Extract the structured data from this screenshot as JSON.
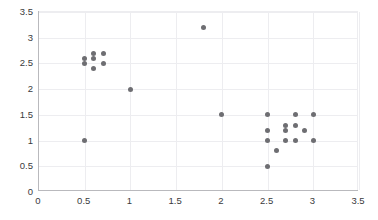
{
  "chart_data": {
    "type": "scatter",
    "title": "",
    "xlabel": "",
    "ylabel": "",
    "xlim": [
      0,
      3.5
    ],
    "ylim": [
      0,
      3.5
    ],
    "xticks": [
      "0",
      "0.5",
      "1",
      "1.5",
      "2",
      "2.5",
      "3",
      "3.5"
    ],
    "xtick_values": [
      0,
      0.5,
      1,
      1.5,
      2,
      2.5,
      3,
      3.5
    ],
    "yticks": [
      "0",
      "0.5",
      "1",
      "1.5",
      "2",
      "2.5",
      "3",
      "3.5"
    ],
    "ytick_values": [
      0,
      0.5,
      1,
      1.5,
      2,
      2.5,
      3,
      3.5
    ],
    "grid": true,
    "legend": null,
    "marker_color": "#6e6e72",
    "grid_color": "#ededf0",
    "axis_color": "#b9b9bd",
    "tick_label_color": "#3a3a3c",
    "series": [
      {
        "name": "points",
        "color": "#6e6e72",
        "marker": "circle",
        "points": [
          [
            0.5,
            2.6
          ],
          [
            0.5,
            2.5
          ],
          [
            0.6,
            2.7
          ],
          [
            0.6,
            2.6
          ],
          [
            0.6,
            2.4
          ],
          [
            0.7,
            2.7
          ],
          [
            0.7,
            2.5
          ],
          [
            0.5,
            1.0
          ],
          [
            1.0,
            2.0
          ],
          [
            1.8,
            3.2
          ],
          [
            2.0,
            1.5
          ],
          [
            2.5,
            1.5
          ],
          [
            2.5,
            1.2
          ],
          [
            2.5,
            1.0
          ],
          [
            2.5,
            0.5
          ],
          [
            2.6,
            0.8
          ],
          [
            2.7,
            1.3
          ],
          [
            2.7,
            1.2
          ],
          [
            2.7,
            1.0
          ],
          [
            2.8,
            1.5
          ],
          [
            2.8,
            1.3
          ],
          [
            2.8,
            1.0
          ],
          [
            2.9,
            1.2
          ],
          [
            3.0,
            1.5
          ],
          [
            3.0,
            1.0
          ]
        ]
      }
    ]
  }
}
